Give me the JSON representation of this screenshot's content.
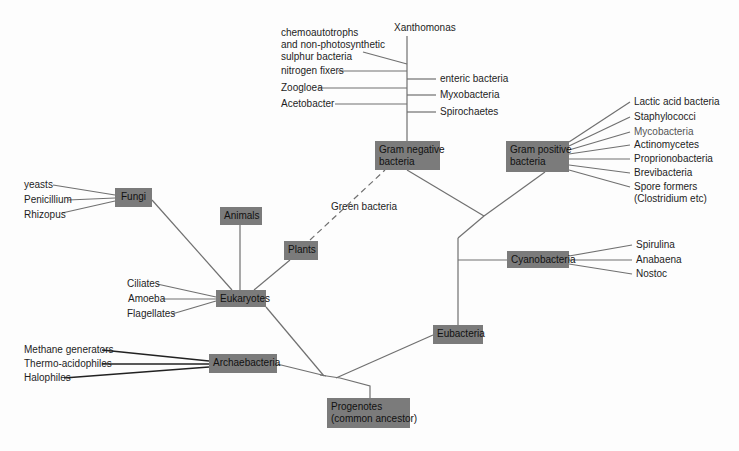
{
  "diagram": {
    "type": "phylogenetic-tree",
    "colors": {
      "node_fill": "#7b7b7b",
      "line": "#6e6e6e",
      "dark_line": "#222222",
      "text": "#1a1a1a"
    },
    "nodes": {
      "progenotes": "Progenotes\n(common ancestor)",
      "progenotes_line1": "Progenotes",
      "progenotes_line2": "(common ancestor)",
      "archaebacteria": "Archaebacteria",
      "eukaryotes": "Eukaryotes",
      "eubacteria": "Eubacteria",
      "fungi": "Fungi",
      "animals": "Animals",
      "plants": "Plants",
      "gram_negative_line1": "Gram negative",
      "gram_negative_line2": "bacteria",
      "gram_positive_line1": "Gram positive",
      "gram_positive_line2": "bacteria",
      "cyanobacteria": "Cyanobacteria"
    },
    "leaves": {
      "fungi": [
        "yeasts",
        "Penicillium",
        "Rhizopus"
      ],
      "eukaryotes": [
        "Ciliates",
        "Amoeba",
        "Flagellates"
      ],
      "archaebacteria": [
        "Methane generators",
        "Thermo-acidophiles",
        "Halophiles"
      ],
      "gram_negative_left": [
        "chemoautotrophs",
        "and non-photosynthetic",
        "sulphur bacteria",
        "nitrogen fixers",
        "Zoogloea",
        "Acetobacter"
      ],
      "gram_negative_top": "Xanthomonas",
      "gram_negative_right": [
        "enteric bacteria",
        "Myxobacteria",
        "Spirochaetes"
      ],
      "gram_positive": [
        "Lactic acid bacteria",
        "Staphylococci",
        "Mycobacteria",
        "Actinomycetes",
        "Proprionobacteria",
        "Brevibacteria",
        "Spore formers",
        "(Clostridium etc)"
      ],
      "cyanobacteria": [
        "Spirulina",
        "Anabaena",
        "Nostoc"
      ],
      "plants_link": "Green bacteria"
    }
  }
}
